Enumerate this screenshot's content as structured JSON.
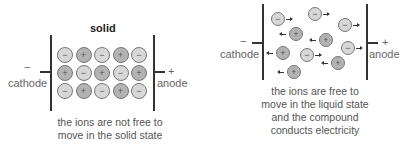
{
  "solid_panel": {
    "title": "solid",
    "cathode_sign": "−",
    "cathode_label": "cathode",
    "anode_sign": "+",
    "anode_label": "anode",
    "caption_line1": "the ions are not free to",
    "caption_line2": "move in the solid state",
    "grid": [
      [
        "−",
        "+",
        "−",
        "+",
        "−"
      ],
      [
        "+",
        "−",
        "+",
        "−",
        "+"
      ],
      [
        "−",
        "+",
        "−",
        "+",
        "−"
      ]
    ]
  },
  "liquid_panel": {
    "cathode_sign": "−",
    "cathode_label": "cathode",
    "anode_sign": "+",
    "anode_label": "anode",
    "caption_line1": "the ions are free to",
    "caption_line2": "move in the liquid state",
    "caption_line3": "and the compound",
    "caption_line4": "conducts electricity",
    "ions": [
      {
        "sign": "−",
        "x": 271,
        "y": 12,
        "dir": "right"
      },
      {
        "sign": "−",
        "x": 308,
        "y": 7,
        "dir": "right"
      },
      {
        "sign": "−",
        "x": 338,
        "y": 18,
        "dir": "right"
      },
      {
        "sign": "+",
        "x": 289,
        "y": 27,
        "dir": "left"
      },
      {
        "sign": "+",
        "x": 319,
        "y": 33,
        "dir": "left"
      },
      {
        "sign": "+",
        "x": 276,
        "y": 46,
        "dir": "left"
      },
      {
        "sign": "−",
        "x": 300,
        "y": 48,
        "dir": "right"
      },
      {
        "sign": "−",
        "x": 341,
        "y": 41,
        "dir": "right"
      },
      {
        "sign": "+",
        "x": 331,
        "y": 56,
        "dir": "left"
      },
      {
        "sign": "+",
        "x": 287,
        "y": 65,
        "dir": "left"
      }
    ]
  },
  "colors": {
    "negative_ion": "#d7d7d7",
    "positive_ion": "#b3b3b3",
    "electrode": "#333333"
  }
}
